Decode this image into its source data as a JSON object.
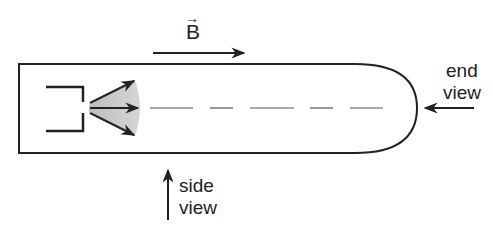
{
  "diagram": {
    "field_label": "B",
    "field_vector_mark": "→",
    "end_view_label": [
      "end",
      "view"
    ],
    "side_view_label": [
      "side",
      "view"
    ],
    "colors": {
      "stroke": "#222222",
      "beam_fill": "#c8c8c8",
      "background": "#ffffff"
    },
    "elements": {
      "tube": "cathode-ray tube with rounded end",
      "gun": "electron gun",
      "beam": "diverging electron beam with three arrows",
      "axis": "dashed tube axis"
    }
  }
}
